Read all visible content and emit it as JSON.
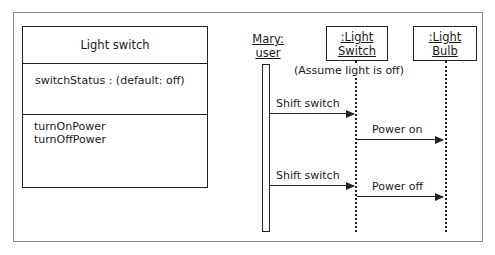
{
  "class_diagram": {
    "class_name": "Light switch",
    "attributes": [
      "switchStatus :  (default: off)"
    ],
    "methods": [
      "turnOnPower",
      "turnOffPower"
    ]
  },
  "sequence_diagram": {
    "participants": [
      {
        "name": "Mary:",
        "type": "user",
        "boxed": false
      },
      {
        "name": ":Light",
        "type": "Switch",
        "boxed": true
      },
      {
        "name": ":Light",
        "type": "Bulb",
        "boxed": true
      }
    ],
    "note": "(Assume light is off)",
    "messages": [
      {
        "from": "Mary:user",
        "to": ":Light Switch",
        "label": "Shift switch"
      },
      {
        "from": ":Light Switch",
        "to": ":Light Bulb",
        "label": "Power on"
      },
      {
        "from": "Mary:user",
        "to": ":Light Switch",
        "label": "Shift switch"
      },
      {
        "from": ":Light Switch",
        "to": ":Light Bulb",
        "label": "Power off"
      }
    ]
  }
}
